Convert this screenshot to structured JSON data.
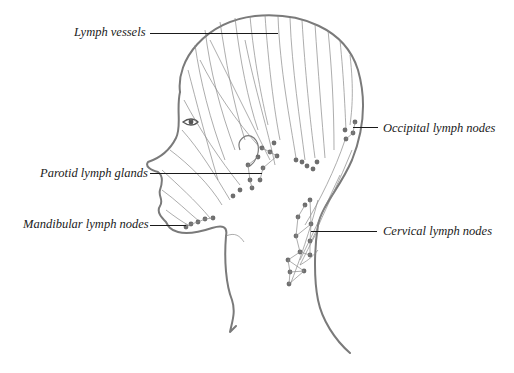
{
  "diagram": {
    "labels": {
      "lymph_vessels": "Lymph vessels",
      "occipital_lymph_nodes": "Occipital lymph nodes",
      "parotid_lymph_glands": "Parotid lymph glands",
      "mandibular_lymph_nodes": "Mandibular lymph nodes",
      "cervical_lymph_nodes": "Cervical lymph nodes"
    },
    "colors": {
      "outline": "#7a7a7a",
      "vessels": "#8a8a8a",
      "nodes": "#6e6e6e",
      "labels": "#1a1a1a",
      "background": "#ffffff"
    }
  }
}
